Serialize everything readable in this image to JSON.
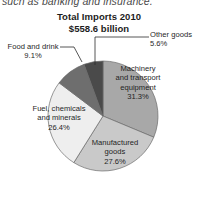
{
  "figure": {
    "preceding_body_text": "such as banking and insurance.",
    "title_line1": "Total Imports 2010",
    "title_line2": "$558.6 billion"
  },
  "labels": {
    "other_goods": {
      "name": "Other goods",
      "pct": "5.6%"
    },
    "food_and_drink": {
      "name": "Food and drink",
      "pct": "9.1%"
    },
    "machinery": {
      "name_line1": "Machinery",
      "name_line2": "and transport",
      "name_line3": "equipment",
      "pct": "31.3%"
    },
    "fuel": {
      "name_line1": "Fuel, chemicals",
      "name_line2": "and minerals",
      "pct": "26.4%"
    },
    "manufactured": {
      "name_line1": "Manufactured",
      "name_line2": "goods",
      "pct": "27.6%"
    }
  },
  "colors": {
    "machinery": "#a8a8a8",
    "manufactured": "#c9c9c9",
    "fuel": "#eeeeee",
    "food_and_drink": "#6e6e6e",
    "other_goods": "#4a4a4a",
    "outline": "#6b6b6b",
    "leader_line": "#2b2b2b",
    "background": "#ffffff",
    "text": "#1f1f1f"
  },
  "chart_data": {
    "type": "pie",
    "title": "Total Imports 2010 $558.6 billion",
    "total_label": "$558.6 billion",
    "total_value": 558.6,
    "total_units": "billion USD",
    "year": 2010,
    "units": "percent of total imports",
    "start_angle_deg": 0,
    "direction": "clockwise",
    "legend": "none (direct labels)",
    "grid": false,
    "categories": [
      "Machinery and transport equipment",
      "Manufactured goods",
      "Fuel, chemicals and minerals",
      "Food and drink",
      "Other goods"
    ],
    "values": [
      31.3,
      27.6,
      26.4,
      9.1,
      5.6
    ],
    "slices": [
      {
        "label": "Machinery and transport equipment",
        "value": 31.3,
        "display": "31.3%",
        "color": "#a8a8a8",
        "label_placement": "inside"
      },
      {
        "label": "Manufactured goods",
        "value": 27.6,
        "display": "27.6%",
        "color": "#c9c9c9",
        "label_placement": "inside"
      },
      {
        "label": "Fuel, chemicals and minerals",
        "value": 26.4,
        "display": "26.4%",
        "color": "#eeeeee",
        "label_placement": "inside"
      },
      {
        "label": "Food and drink",
        "value": 9.1,
        "display": "9.1%",
        "color": "#6e6e6e",
        "label_placement": "outside-left-leader"
      },
      {
        "label": "Other goods",
        "value": 5.6,
        "display": "5.6%",
        "color": "#4a4a4a",
        "label_placement": "outside-right-leader"
      }
    ],
    "sum": 100.0
  }
}
